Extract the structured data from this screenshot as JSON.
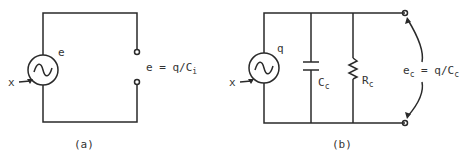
{
  "diagram_a": {
    "source_label": "e",
    "input_label": "x",
    "output_expr_lhs": "e = q/C",
    "output_expr_sub": "i",
    "caption": "(a)"
  },
  "diagram_b": {
    "source_label": "q",
    "input_label": "x",
    "capacitor_label": "C",
    "capacitor_sub": "c",
    "resistor_label": "R",
    "resistor_sub": "c",
    "output_e": "e",
    "output_e_sub": "c",
    "output_eq": " = q/C",
    "output_eq_sub": "c",
    "caption": "(b)"
  }
}
